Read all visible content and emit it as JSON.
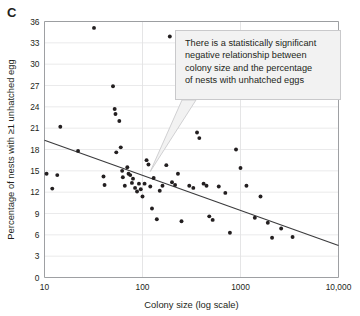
{
  "panel": {
    "label": "C"
  },
  "chart_data": {
    "type": "scatter",
    "title": "",
    "xlabel": "Colony size (log scale)",
    "ylabel": "Percentage of nests with ≥1 unhatched egg",
    "xscale": "log",
    "xlim": [
      10,
      10000
    ],
    "ylim": [
      0,
      36
    ],
    "xticks": [
      10,
      100,
      1000,
      10000
    ],
    "xtick_labels": [
      "10",
      "100",
      "1000",
      "10,000"
    ],
    "yticks": [
      0,
      3,
      6,
      9,
      12,
      15,
      18,
      21,
      24,
      27,
      30,
      33,
      36
    ],
    "ytick_labels": [
      "0",
      "3",
      "6",
      "9",
      "12",
      "15",
      "18",
      "21",
      "24",
      "27",
      "30",
      "33",
      "36"
    ],
    "grid": "horizontal-and-vertical",
    "legend": "none",
    "points": [
      [
        10.5,
        14.6
      ],
      [
        12.0,
        12.5
      ],
      [
        13.5,
        14.4
      ],
      [
        14.5,
        21.2
      ],
      [
        22.0,
        17.8
      ],
      [
        32.0,
        35.1
      ],
      [
        40.0,
        14.2
      ],
      [
        41.0,
        13.0
      ],
      [
        50.0,
        26.9
      ],
      [
        52.0,
        23.7
      ],
      [
        53.0,
        23.0
      ],
      [
        54.0,
        17.6
      ],
      [
        58.0,
        22.0
      ],
      [
        60.0,
        18.3
      ],
      [
        62.0,
        15.0
      ],
      [
        63.0,
        14.1
      ],
      [
        66.0,
        12.9
      ],
      [
        70.0,
        15.5
      ],
      [
        72.0,
        14.6
      ],
      [
        75.0,
        14.4
      ],
      [
        78.0,
        13.3
      ],
      [
        80.0,
        13.9
      ],
      [
        84.0,
        12.6
      ],
      [
        88.0,
        12.1
      ],
      [
        92.0,
        13.2
      ],
      [
        96.0,
        12.4
      ],
      [
        100.0,
        11.4
      ],
      [
        105.0,
        13.2
      ],
      [
        110.0,
        16.5
      ],
      [
        115.0,
        15.9
      ],
      [
        120.0,
        12.8
      ],
      [
        125.0,
        9.7
      ],
      [
        130.0,
        14.0
      ],
      [
        140.0,
        8.2
      ],
      [
        150.0,
        12.2
      ],
      [
        160.0,
        12.9
      ],
      [
        175.0,
        15.8
      ],
      [
        190.0,
        33.9
      ],
      [
        200.0,
        13.4
      ],
      [
        215.0,
        13.0
      ],
      [
        230.0,
        14.6
      ],
      [
        250.0,
        7.9
      ],
      [
        270.0,
        27.7
      ],
      [
        300.0,
        12.9
      ],
      [
        330.0,
        12.6
      ],
      [
        360.0,
        20.4
      ],
      [
        380.0,
        19.6
      ],
      [
        420.0,
        13.2
      ],
      [
        450.0,
        12.9
      ],
      [
        480.0,
        8.6
      ],
      [
        520.0,
        8.1
      ],
      [
        600.0,
        12.8
      ],
      [
        700.0,
        11.9
      ],
      [
        780.0,
        6.3
      ],
      [
        900.0,
        18.0
      ],
      [
        1000.0,
        15.4
      ],
      [
        1150.0,
        12.9
      ],
      [
        1400.0,
        8.4
      ],
      [
        1600.0,
        11.4
      ],
      [
        1900.0,
        7.7
      ],
      [
        2100.0,
        5.6
      ],
      [
        2600.0,
        6.9
      ],
      [
        3400.0,
        5.7
      ]
    ],
    "fit_line": {
      "x0": 10,
      "y0": 19.3,
      "x1": 10000,
      "y1": 4.5
    }
  },
  "annotation": {
    "text": "There is a statistically significant\nnegative relationship between\ncolony size and the percentage\nof nests with unhatched eggs"
  }
}
